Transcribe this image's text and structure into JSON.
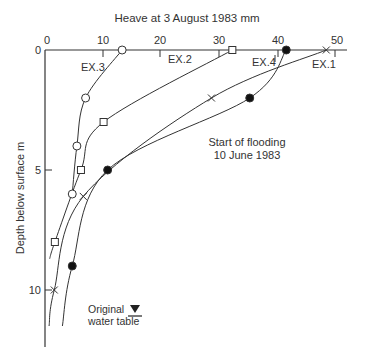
{
  "chart_data": {
    "type": "line",
    "title": "Heave at 3 August 1983 mm",
    "xlabel": "Heave at 3 August 1983 mm",
    "ylabel": "Depth below surface m",
    "xlim": [
      0,
      50
    ],
    "ylim": [
      0,
      12
    ],
    "x_ticks": [
      0,
      10,
      20,
      30,
      40,
      50
    ],
    "y_ticks": [
      0,
      5,
      10
    ],
    "x_axis_position": "top",
    "y_inverted": true,
    "grid": false,
    "series": [
      {
        "name": "EX.1",
        "marker": "x",
        "points": [
          [
            48.5,
            0
          ],
          [
            28.7,
            2.0
          ],
          [
            6.6,
            6.1
          ],
          [
            1.6,
            10.0
          ]
        ],
        "curve_end": [
          0.7,
          11.5
        ]
      },
      {
        "name": "EX.2",
        "marker": "open-square",
        "points": [
          [
            32.3,
            0
          ],
          [
            10.1,
            3.0
          ],
          [
            6.2,
            5.0
          ],
          [
            1.7,
            8.0
          ]
        ],
        "curve_end": [
          0.8,
          8.7
        ]
      },
      {
        "name": "EX.3",
        "marker": "open-circle",
        "points": [
          [
            13.3,
            0
          ],
          [
            7.0,
            2.0
          ],
          [
            5.5,
            4.0
          ],
          [
            4.7,
            6.0
          ]
        ],
        "curve_end": [
          4.7,
          6.0
        ]
      },
      {
        "name": "EX.4",
        "marker": "filled-circle",
        "points": [
          [
            41.6,
            0
          ],
          [
            35.3,
            2.0
          ],
          [
            10.8,
            5.0
          ],
          [
            4.7,
            9.0
          ]
        ],
        "curve_end": [
          3.0,
          11.5
        ]
      }
    ],
    "annotations": [
      {
        "text": "Start of flooding",
        "x": 30,
        "y": 4.6
      },
      {
        "text": "10 June 1983",
        "x": 30,
        "y": 5.2
      },
      {
        "text": "Original",
        "x": 7.5,
        "y": 10.4
      },
      {
        "text": "water table",
        "x": 7.5,
        "y": 11.0
      }
    ],
    "series_labels": [
      {
        "text": "EX.3",
        "x": 7.6,
        "y": 0.8
      },
      {
        "text": "EX.2",
        "x": 23.4,
        "y": 0.5
      },
      {
        "text": "EX.4",
        "x": 36.5,
        "y": 0.7
      },
      {
        "text": "EX.1",
        "x": 47.0,
        "y": 0.9
      }
    ]
  },
  "labels": {
    "title": "Heave at 3 August 1983 mm",
    "ylabel": "Depth below surface m",
    "flood1": "Start of flooding",
    "flood2": "10 June 1983",
    "wt1": "Original",
    "wt2": "water table",
    "ex1": "EX.1",
    "ex2": "EX.2",
    "ex3": "EX.3",
    "ex4": "EX.4",
    "x0": "0",
    "x10": "10",
    "x20": "20",
    "x30": "30",
    "x40": "40",
    "x50": "50",
    "y0": "0",
    "y5": "5",
    "y10": "10"
  }
}
